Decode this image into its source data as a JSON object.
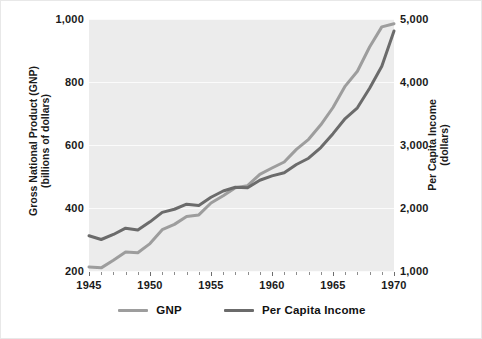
{
  "chart_data": {
    "type": "line",
    "title": "",
    "xlabel": "",
    "ylabel": "Gross National Product (GNP)\n(billions of dollars)",
    "y2label": "Per Capita Income\n(dollars)",
    "xlim": [
      1945,
      1970
    ],
    "ylim": [
      200,
      1000
    ],
    "y2lim": [
      1000,
      5000
    ],
    "grid": true,
    "legend_position": "bottom-center",
    "x": [
      1945,
      1946,
      1947,
      1948,
      1949,
      1950,
      1951,
      1952,
      1953,
      1954,
      1955,
      1956,
      1957,
      1958,
      1959,
      1960,
      1961,
      1962,
      1963,
      1964,
      1965,
      1966,
      1967,
      1968,
      1969,
      1970
    ],
    "series": [
      {
        "name": "GNP",
        "axis": "left",
        "units": "billions of dollars",
        "color": "#9d9d9d",
        "values": [
          213,
          210,
          234,
          260,
          258,
          287,
          331,
          348,
          373,
          378,
          416,
          439,
          464,
          471,
          507,
          527,
          546,
          586,
          618,
          664,
          719,
          787,
          834,
          911,
          975,
          985
        ]
      },
      {
        "name": "Per Capita Income",
        "axis": "right",
        "units": "dollars",
        "color": "#6b6b6b",
        "values": [
          1560,
          1500,
          1580,
          1680,
          1650,
          1780,
          1930,
          1980,
          2060,
          2040,
          2170,
          2270,
          2330,
          2320,
          2440,
          2510,
          2560,
          2690,
          2790,
          2960,
          3180,
          3420,
          3590,
          3900,
          4250,
          4810
        ]
      }
    ],
    "xticks": [
      1945,
      1950,
      1955,
      1960,
      1965,
      1970
    ],
    "xtick_labels": [
      "1945",
      "1950",
      "1955",
      "1960",
      "1965",
      "1970"
    ],
    "yticks": [
      200,
      400,
      600,
      800,
      1000
    ],
    "ytick_labels": [
      "200",
      "400",
      "600",
      "800",
      "1,000"
    ],
    "y2ticks": [
      1000,
      2000,
      3000,
      4000,
      5000
    ],
    "y2tick_labels": [
      "1,000",
      "2,000",
      "3,000",
      "4,000",
      "5,000"
    ],
    "xminor_ticks": [
      1946,
      1947,
      1948,
      1949,
      1951,
      1952,
      1953,
      1954,
      1956,
      1957,
      1958,
      1959,
      1961,
      1962,
      1963,
      1964,
      1966,
      1967,
      1968,
      1969
    ],
    "legend": [
      {
        "label": "GNP",
        "color": "#9d9d9d"
      },
      {
        "label": "Per Capita Income",
        "color": "#6b6b6b"
      }
    ],
    "plot_background": "#ececec",
    "gridline_color": "#fbfbfb"
  }
}
